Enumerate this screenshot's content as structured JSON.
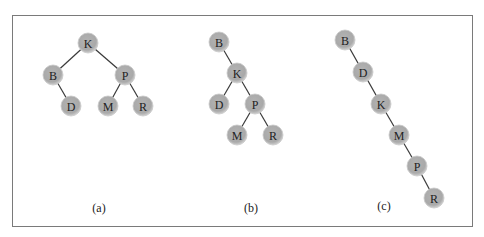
{
  "figure": {
    "frame": {
      "x": 12,
      "y": 15,
      "width": 461,
      "height": 212
    },
    "colors": {
      "node_fill": "#ababab",
      "node_highlight": "#d2d2d2",
      "edge": "#3a3a3a",
      "frame": "#7a7a7a",
      "text": "#222222"
    },
    "node_radius": 10,
    "trees": [
      {
        "id": "a",
        "caption": "(a)",
        "caption_pos": [
          99,
          208
        ],
        "nodes": [
          {
            "label": "K",
            "x": 88,
            "y": 43
          },
          {
            "label": "B",
            "x": 53,
            "y": 75
          },
          {
            "label": "P",
            "x": 125,
            "y": 75
          },
          {
            "label": "D",
            "x": 71,
            "y": 106
          },
          {
            "label": "M",
            "x": 108,
            "y": 106
          },
          {
            "label": "R",
            "x": 143,
            "y": 106
          }
        ],
        "edges": [
          [
            "K",
            "B"
          ],
          [
            "K",
            "P"
          ],
          [
            "B",
            "D"
          ],
          [
            "P",
            "M"
          ],
          [
            "P",
            "R"
          ]
        ]
      },
      {
        "id": "b",
        "caption": "(b)",
        "caption_pos": [
          251,
          208
        ],
        "nodes": [
          {
            "label": "B",
            "x": 219,
            "y": 42
          },
          {
            "label": "K",
            "x": 237,
            "y": 73
          },
          {
            "label": "D",
            "x": 219,
            "y": 104
          },
          {
            "label": "P",
            "x": 255,
            "y": 104
          },
          {
            "label": "M",
            "x": 237,
            "y": 135
          },
          {
            "label": "R",
            "x": 273,
            "y": 135
          }
        ],
        "edges": [
          [
            "B",
            "K"
          ],
          [
            "K",
            "D"
          ],
          [
            "K",
            "P"
          ],
          [
            "P",
            "M"
          ],
          [
            "P",
            "R"
          ]
        ]
      },
      {
        "id": "c",
        "caption": "(c)",
        "caption_pos": [
          384,
          206
        ],
        "nodes": [
          {
            "label": "B",
            "x": 345,
            "y": 40
          },
          {
            "label": "D",
            "x": 363,
            "y": 72
          },
          {
            "label": "K",
            "x": 381,
            "y": 104
          },
          {
            "label": "M",
            "x": 399,
            "y": 135
          },
          {
            "label": "P",
            "x": 417,
            "y": 166
          },
          {
            "label": "R",
            "x": 434,
            "y": 198
          }
        ],
        "edges": [
          [
            "B",
            "D"
          ],
          [
            "D",
            "K"
          ],
          [
            "K",
            "M"
          ],
          [
            "M",
            "P"
          ],
          [
            "P",
            "R"
          ]
        ]
      }
    ]
  }
}
